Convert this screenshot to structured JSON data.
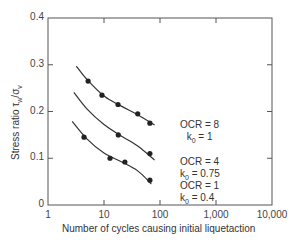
{
  "chart_data": {
    "type": "line",
    "title": "",
    "xlabel": "Number of cycles causing initial liquetaction",
    "ylabel": "Stress ratio τw/σv",
    "xscale": "log",
    "xlim": [
      1,
      10000
    ],
    "ylim": [
      0,
      0.4
    ],
    "grid": false,
    "x_ticks": [
      "1",
      "10",
      "100",
      "1,000",
      "10,000"
    ],
    "y_ticks": [
      "0",
      "0.1",
      "0.2",
      "0.3",
      "0.4"
    ],
    "series": [
      {
        "name": "OCR = 8, k0 = 1",
        "label_line1": "OCR = 8",
        "label_line2": "k0 = 1",
        "curve": [
          [
            3.2,
            0.297
          ],
          [
            5,
            0.268
          ],
          [
            10,
            0.233
          ],
          [
            20,
            0.212
          ],
          [
            40,
            0.193
          ],
          [
            80,
            0.171
          ]
        ],
        "points": [
          [
            5.2,
            0.265
          ],
          [
            9.2,
            0.235
          ],
          [
            17.8,
            0.215
          ],
          [
            40,
            0.195
          ],
          [
            66,
            0.175
          ]
        ]
      },
      {
        "name": "OCR = 4, k0 = 0.75",
        "label_line1": "OCR = 4",
        "label_line2": "k0 = 0.75",
        "curve": [
          [
            2.9,
            0.241
          ],
          [
            5,
            0.205
          ],
          [
            10,
            0.172
          ],
          [
            20,
            0.148
          ],
          [
            40,
            0.126
          ],
          [
            80,
            0.096
          ]
        ],
        "points": [
          [
            18,
            0.15
          ],
          [
            66,
            0.11
          ]
        ]
      },
      {
        "name": "OCR = 1, k0 = 0.4",
        "label_line1": "OCR = 1",
        "label_line2": "k0 = 0.4",
        "curve": [
          [
            2.7,
            0.179
          ],
          [
            5,
            0.141
          ],
          [
            10,
            0.111
          ],
          [
            20,
            0.093
          ],
          [
            40,
            0.073
          ],
          [
            70,
            0.045
          ]
        ],
        "points": [
          [
            4.4,
            0.145
          ],
          [
            12.8,
            0.1
          ],
          [
            23.6,
            0.092
          ],
          [
            66,
            0.053
          ]
        ]
      }
    ]
  },
  "labels": {
    "xlabel": "Number of cycles causing initial liquetaction",
    "ylabel_main": "Stress ratio τ",
    "ylabel_sub1": "w",
    "ylabel_mid": "/σ",
    "ylabel_sub2": "v",
    "x_ticks": [
      "1",
      "10",
      "100",
      "1,000",
      "10,000"
    ],
    "y_ticks": [
      "0",
      "0.1",
      "0.2",
      "0.3",
      "0.4"
    ],
    "ocr8_l1": "OCR = 8",
    "ocr8_k": "k",
    "ocr8_sub": "0",
    "ocr8_v": " = 1",
    "ocr4_l1": "OCR = 4",
    "ocr4_k": "k",
    "ocr4_sub": "0",
    "ocr4_v": " = 0.75",
    "ocr1_l1": "OCR = 1",
    "ocr1_k": "k",
    "ocr1_sub": "0",
    "ocr1_v": " = 0.4"
  }
}
